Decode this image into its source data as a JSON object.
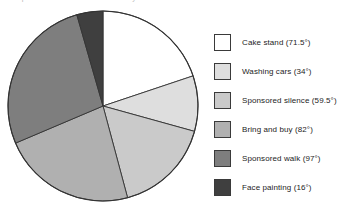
{
  "top_caption_sliver": "and a pie chart to show how the money was raised",
  "chart_data": {
    "type": "pie",
    "title": "",
    "subtitle": "",
    "xlabel": "",
    "ylabel": "",
    "units": "degrees",
    "total_degrees": 360,
    "start_angle_deg": 0,
    "direction": "clockwise",
    "legend_position": "right",
    "grid": false,
    "categories": [
      "Cake stand",
      "Washing cars",
      "Sponsored silence",
      "Bring and buy",
      "Sponsored walk",
      "Face painting"
    ],
    "values": [
      71.5,
      34,
      59.5,
      82,
      97,
      16
    ],
    "colors": [
      "#ffffff",
      "#dedede",
      "#cacaca",
      "#b0b0b0",
      "#7e7e7e",
      "#3f3f3f"
    ],
    "slice_outline_color": "#333333",
    "annotations": [
      "Cake stand (71.5°)",
      "Washing cars (34°)",
      "Sponsored silence (59.5°)",
      "Bring and buy (82°)",
      "Sponsored walk (97°)",
      "Face painting (16°)"
    ]
  },
  "legend": {
    "items": [
      {
        "label": "Cake stand (71.5°)",
        "color": "#ffffff",
        "name": "cake-stand"
      },
      {
        "label": "Washing cars (34°)",
        "color": "#dedede",
        "name": "washing-cars"
      },
      {
        "label": "Sponsored silence (59.5°)",
        "color": "#cacaca",
        "name": "sponsored-silence"
      },
      {
        "label": "Bring and buy (82°)",
        "color": "#b0b0b0",
        "name": "bring-and-buy"
      },
      {
        "label": "Sponsored walk (97°)",
        "color": "#7e7e7e",
        "name": "sponsored-walk"
      },
      {
        "label": "Face painting (16°)",
        "color": "#3f3f3f",
        "name": "face-painting"
      }
    ]
  }
}
